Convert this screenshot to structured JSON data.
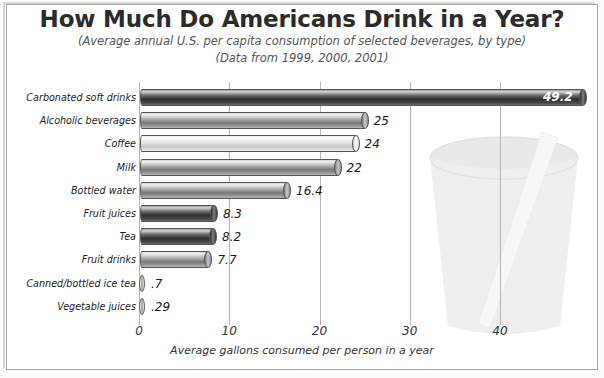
{
  "chart_data": {
    "type": "bar",
    "orientation": "horizontal",
    "title": "How Much Do Americans Drink in a Year?",
    "subtitle_1": "(Average annual U.S. per capita consumption of selected beverages, by type)",
    "subtitle_2": "(Data from 1999, 2000, 2001)",
    "xlabel": "Average gallons consumed per person in a year",
    "ylabel": "",
    "xlim": [
      0,
      53
    ],
    "xticks": [
      0,
      10,
      20,
      30,
      40
    ],
    "xtick_labels": [
      "0",
      "10",
      "20",
      "30",
      "40"
    ],
    "grid": true,
    "legend": "none",
    "categories": [
      "Carbonated soft drinks",
      "Alcoholic beverages",
      "Coffee",
      "Milk",
      "Bottled water",
      "Fruit juices",
      "Tea",
      "Fruit drinks",
      "Canned/bottled ice tea",
      "Vegetable juices"
    ],
    "values": [
      49.2,
      25,
      24,
      22,
      16.4,
      8.3,
      8.2,
      7.7,
      0.7,
      0.29
    ],
    "value_labels": [
      "49.2",
      "25",
      "24",
      "22",
      "16.4",
      "8.3",
      "8.2",
      "7.7",
      ".7",
      ".29"
    ],
    "bar_shades": [
      "dark",
      "medium",
      "light",
      "medium",
      "medium",
      "dark",
      "dark",
      "medium",
      "light",
      "light"
    ],
    "annotation": "Background illustration of a drinking cup with a straw"
  },
  "colors": {
    "background": "#ffffff",
    "frame": "#a9a9a9",
    "gridline": "#b6b6b6",
    "axis": "#8a8a8a",
    "text": "#1d1d1d",
    "title": "#2b2b2b",
    "subtitle": "#555555",
    "bar_dark": "#3a3a3a",
    "bar_medium": "#8c8c8c",
    "bar_light": "#e2e2e2",
    "watermark": "#e4e4e4"
  }
}
